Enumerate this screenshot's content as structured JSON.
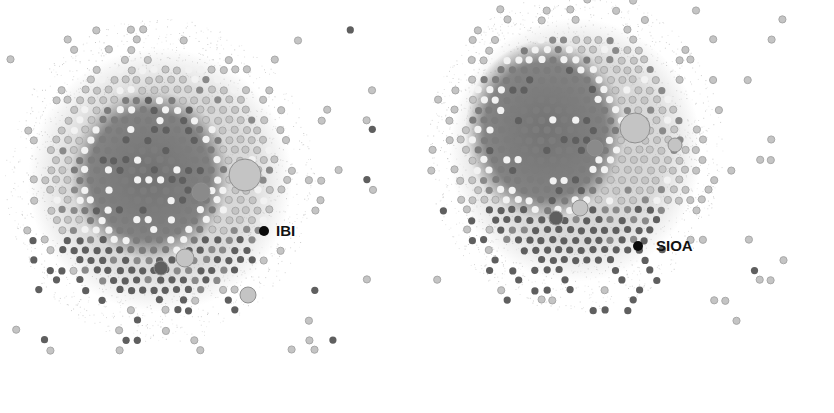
{
  "figure": {
    "type": "network-graph-pair",
    "colors": {
      "background": "#ffffff",
      "haze_dark": "#6e6e6e",
      "haze_light": "#bdbdbd",
      "node_dark": "#5e5e5e",
      "node_mid": "#8a8a8a",
      "node_light": "#c4c4c4",
      "node_white": "#f2f2f2",
      "highlight_node": "#0a0a0a",
      "label": "#111111"
    },
    "panels": [
      {
        "id": "left",
        "highlight": {
          "label": "IBI",
          "cx": 264,
          "cy": 231,
          "r": 5,
          "label_x": 276,
          "label_y": 223
        },
        "core": {
          "cx": 160,
          "cy": 180,
          "rx": 115,
          "ry": 120
        },
        "dark_core": {
          "cx": 150,
          "cy": 175,
          "rx": 80,
          "ry": 85
        },
        "hubs": [
          {
            "cx": 245,
            "cy": 175,
            "r": 16,
            "shade": "light"
          },
          {
            "cx": 201,
            "cy": 192,
            "r": 9,
            "shade": "mid"
          },
          {
            "cx": 161,
            "cy": 268,
            "r": 7,
            "shade": "dark"
          },
          {
            "cx": 185,
            "cy": 258,
            "r": 9,
            "shade": "light"
          },
          {
            "cx": 248,
            "cy": 295,
            "r": 8,
            "shade": "light"
          }
        ]
      },
      {
        "id": "right",
        "highlight": {
          "label": "SIOA",
          "cx": 638,
          "cy": 246,
          "r": 5,
          "label_x": 656,
          "label_y": 238
        },
        "core": {
          "cx": 575,
          "cy": 150,
          "rx": 110,
          "ry": 120
        },
        "dark_core": {
          "cx": 545,
          "cy": 130,
          "rx": 80,
          "ry": 90
        },
        "hubs": [
          {
            "cx": 635,
            "cy": 128,
            "r": 15,
            "shade": "light"
          },
          {
            "cx": 595,
            "cy": 148,
            "r": 8,
            "shade": "mid"
          },
          {
            "cx": 556,
            "cy": 218,
            "r": 7,
            "shade": "dark"
          },
          {
            "cx": 580,
            "cy": 208,
            "r": 8,
            "shade": "light"
          },
          {
            "cx": 675,
            "cy": 145,
            "r": 7,
            "shade": "light"
          }
        ]
      }
    ]
  },
  "labels": {
    "left_node": "IBI",
    "right_node": "SIOA"
  }
}
